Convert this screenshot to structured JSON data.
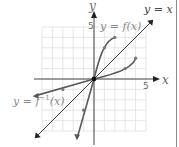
{
  "chart_data": {
    "type": "line",
    "title": "",
    "xlabel": "x",
    "ylabel": "y",
    "xlim": [
      -5,
      5
    ],
    "ylim": [
      -5,
      5
    ],
    "grid": true,
    "tick_labels": {
      "x": "5",
      "y": "5"
    },
    "series": [
      {
        "name": "y = f(x)",
        "label": "y = f(x)",
        "points": [
          [
            -1.6,
            -5.5
          ],
          [
            -1,
            -3
          ],
          [
            0,
            0
          ],
          [
            1,
            3
          ],
          [
            2,
            4
          ]
        ],
        "marked_points": [
          [
            -1,
            -3
          ],
          [
            0,
            0
          ],
          [
            1,
            3
          ],
          [
            2,
            4
          ]
        ],
        "color": "#5a5a5a"
      },
      {
        "name": "y = f^-1(x)",
        "label": "y = f⁻¹(x)",
        "points": [
          [
            -5.5,
            -1.6
          ],
          [
            -3,
            -1
          ],
          [
            0,
            0
          ],
          [
            3,
            1
          ],
          [
            4,
            2
          ]
        ],
        "marked_points": [
          [
            -3,
            -1
          ],
          [
            0,
            0
          ],
          [
            3,
            1
          ],
          [
            4,
            2
          ]
        ],
        "color": "#5a5a5a"
      },
      {
        "name": "y = x",
        "label": "y = x",
        "points": [
          [
            -5.5,
            -5.5
          ],
          [
            5.5,
            5.5
          ]
        ],
        "color": "#3a3a3a"
      }
    ],
    "legend": "inline labels"
  },
  "labels": {
    "y_axis": "y",
    "x_axis": "x",
    "f": "y = f(x)",
    "finv_prefix": "y = f",
    "finv_sup": "−1",
    "finv_suffix": "(x)",
    "identity": "y = x",
    "tick_x5": "5",
    "tick_y5": "5"
  }
}
